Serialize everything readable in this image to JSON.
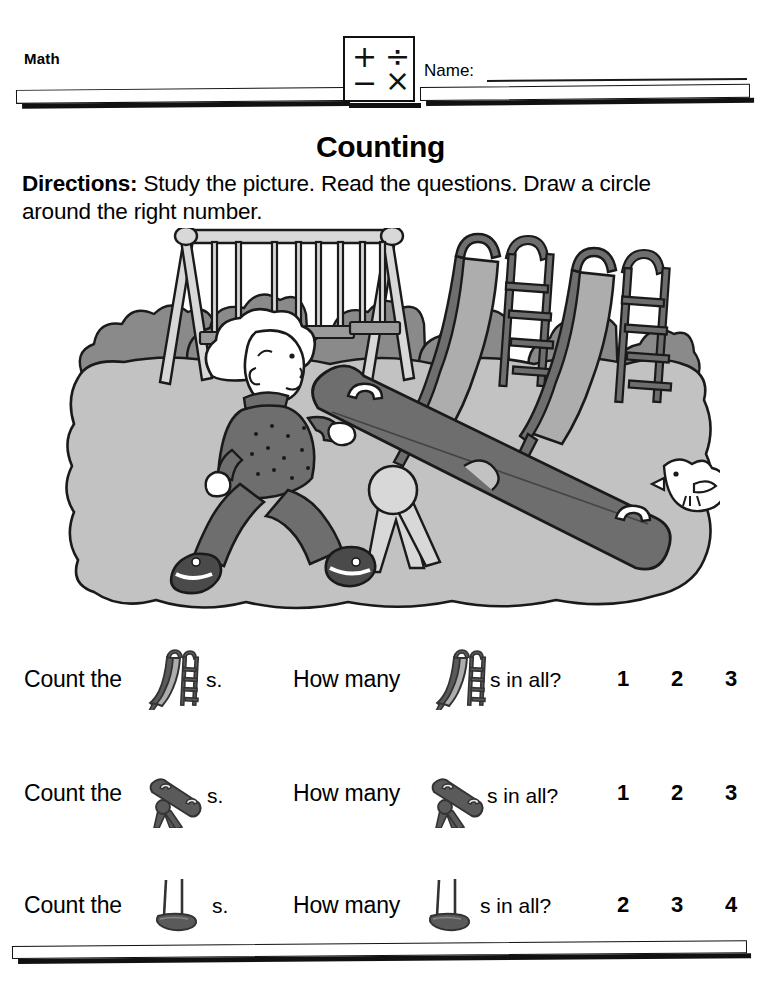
{
  "header": {
    "subject": "Math",
    "name_label": "Name:",
    "name_value": "",
    "math_icon": {
      "plus": "+",
      "divide": "÷",
      "minus": "−",
      "times": "×"
    }
  },
  "title": "Counting",
  "directions": {
    "label": "Directions:",
    "text": " Study the picture. Read the questions. Draw a circle around the right number."
  },
  "illustration": {
    "alt": "playground-scene",
    "objects": [
      {
        "name": "swing-set",
        "swings": 4
      },
      {
        "name": "slide",
        "count": 2
      },
      {
        "name": "seesaw",
        "count": 1
      },
      {
        "name": "child-running",
        "count": 1
      },
      {
        "name": "bird",
        "count": 1
      },
      {
        "name": "bushes",
        "count": 9
      }
    ],
    "colors": {
      "ground": "#c2c2c2",
      "bush": "#8a8a8a",
      "equipment_dark": "#6e6e6e",
      "equipment_light": "#adadad",
      "outline": "#1a1a1a"
    }
  },
  "questions": [
    {
      "count_text": "Count the",
      "icon": "slide-icon",
      "suffix_a": "s.",
      "howmany_text": "How many",
      "suffix_b": "s in all?",
      "choices": [
        "1",
        "2",
        "3"
      ]
    },
    {
      "count_text": "Count the",
      "icon": "seesaw-icon",
      "suffix_a": "s.",
      "howmany_text": "How many",
      "suffix_b": "s in all?",
      "choices": [
        "1",
        "2",
        "3"
      ]
    },
    {
      "count_text": "Count the",
      "icon": "swing-icon",
      "suffix_a": "s.",
      "howmany_text": "How many",
      "suffix_b": "s in all?",
      "choices": [
        "2",
        "3",
        "4"
      ]
    }
  ]
}
